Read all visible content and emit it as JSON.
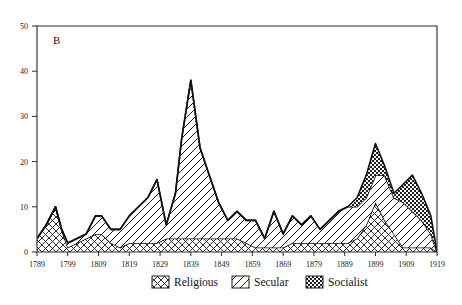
{
  "figure": {
    "panel_label": "B",
    "background_color": "#ffffff",
    "line_color": "#111111"
  },
  "legend": {
    "position": "bottom-center",
    "entries": [
      {
        "label": "Religious",
        "pattern": "cross-hatch-diamond",
        "swatch_name": "legend-swatch-religious"
      },
      {
        "label": "Secular",
        "pattern": "diagonal-lines",
        "swatch_name": "legend-swatch-secular"
      },
      {
        "label": "Socialist",
        "pattern": "fine-checkerboard",
        "swatch_name": "legend-swatch-socialist"
      }
    ]
  },
  "chart_data": {
    "type": "area",
    "stacked": true,
    "title": "B",
    "xlabel": "",
    "ylabel": "",
    "xlim": [
      1789,
      1919
    ],
    "ylim": [
      0,
      50
    ],
    "grid": false,
    "legend_position": "bottom-center",
    "yticks": [
      0,
      10,
      20,
      30,
      40,
      50
    ],
    "xticks": [
      1789,
      1799,
      1809,
      1819,
      1829,
      1839,
      1849,
      1859,
      1869,
      1879,
      1889,
      1899,
      1909,
      1919
    ],
    "x": [
      1789,
      1792,
      1795,
      1797,
      1799,
      1802,
      1805,
      1808,
      1810,
      1813,
      1816,
      1819,
      1822,
      1825,
      1828,
      1831,
      1834,
      1836,
      1839,
      1842,
      1845,
      1848,
      1851,
      1854,
      1857,
      1860,
      1863,
      1866,
      1869,
      1872,
      1875,
      1878,
      1881,
      1884,
      1887,
      1890,
      1893,
      1896,
      1899,
      1902,
      1905,
      1908,
      1911,
      1914,
      1917,
      1919
    ],
    "series": [
      {
        "name": "Religious",
        "pattern": "cross-hatch-diamond",
        "values": [
          3,
          6,
          10,
          5,
          1,
          2,
          3,
          4,
          4,
          2,
          1,
          2,
          2,
          2,
          2,
          3,
          3,
          3,
          3,
          3,
          3,
          3,
          3,
          3,
          2,
          1,
          1,
          1,
          1,
          2,
          2,
          2,
          2,
          2,
          2,
          2,
          3,
          6,
          11,
          7,
          4,
          1,
          1,
          1,
          1,
          0
        ]
      },
      {
        "name": "Secular",
        "pattern": "diagonal-lines",
        "values": [
          0,
          0,
          0,
          0,
          1,
          1,
          1,
          4,
          4,
          3,
          4,
          6,
          8,
          10,
          14,
          3,
          10,
          22,
          35,
          20,
          14,
          8,
          4,
          6,
          5,
          6,
          2,
          8,
          3,
          6,
          4,
          6,
          3,
          5,
          7,
          8,
          7,
          6,
          6,
          10,
          8,
          10,
          8,
          6,
          3,
          0
        ]
      },
      {
        "name": "Socialist",
        "pattern": "fine-checkerboard",
        "values": [
          0,
          0,
          0,
          0,
          0,
          0,
          0,
          0,
          0,
          0,
          0,
          0,
          0,
          0,
          0,
          0,
          0,
          0,
          0,
          0,
          0,
          0,
          0,
          0,
          0,
          0,
          0,
          0,
          0,
          0,
          0,
          0,
          0,
          0,
          0,
          0,
          2,
          5,
          7,
          2,
          1,
          4,
          8,
          6,
          4,
          0
        ]
      }
    ]
  }
}
